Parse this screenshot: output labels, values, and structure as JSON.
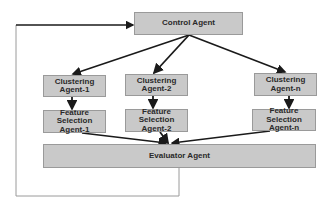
{
  "diagram": {
    "type": "flowchart",
    "colors": {
      "box_fill": "#c9c9c9",
      "box_border": "#9a9a9a",
      "arrow": "#1a1a1a",
      "feedback_line": "#9a9a9a",
      "text": "#2a2a2a"
    },
    "nodes": {
      "control": {
        "label": "Control Agent"
      },
      "clustering_1": {
        "label": "Clustering\nAgent-1"
      },
      "clustering_2": {
        "label": "Clustering\nAgent-2"
      },
      "clustering_n": {
        "label": "Clustering\nAgent-n"
      },
      "feature_1": {
        "label": "Feature\nSelection\nAgent-1"
      },
      "feature_2": {
        "label": "Feature\nSelection\nAgent-2"
      },
      "feature_n": {
        "label": "Feature\nSelection\nAgent-n"
      },
      "evaluator": {
        "label": "Evaluator Agent"
      }
    },
    "edges": [
      {
        "from": "control",
        "to": "clustering_1"
      },
      {
        "from": "control",
        "to": "clustering_2"
      },
      {
        "from": "control",
        "to": "clustering_n"
      },
      {
        "from": "clustering_1",
        "to": "feature_1"
      },
      {
        "from": "clustering_2",
        "to": "feature_2"
      },
      {
        "from": "clustering_n",
        "to": "feature_n"
      },
      {
        "from": "feature_1",
        "to": "evaluator"
      },
      {
        "from": "feature_2",
        "to": "evaluator"
      },
      {
        "from": "feature_n",
        "to": "evaluator"
      },
      {
        "from": "evaluator",
        "to": "control",
        "style": "feedback-loop"
      }
    ]
  }
}
